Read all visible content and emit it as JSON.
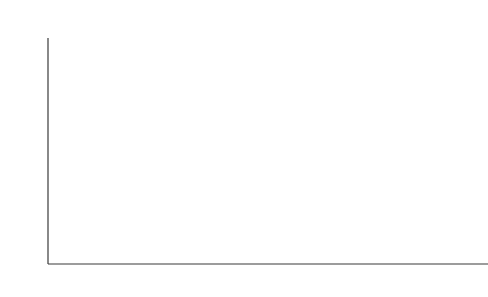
{
  "chart_data": {
    "type": "area",
    "title": "",
    "xlabel": "",
    "ylabel": "EJ",
    "ylim": [
      0,
      1200
    ],
    "ytick_values": [
      0,
      200,
      400,
      600,
      800,
      1000,
      1200
    ],
    "ytick_labels": [
      "0",
      "200",
      "400",
      "600",
      "800",
      "1000",
      "1200"
    ],
    "xtick_labels": [
      "1950",
      "1960",
      "1970",
      "1980",
      "1990",
      "2000",
      "2008",
      "2030",
      "2050"
    ],
    "grid": false,
    "legend_position": "upper-left",
    "legend": [
      {
        "label": "Other renewables",
        "color": "#ffffff"
      },
      {
        "label": "Hydro",
        "color": "#111111"
      },
      {
        "label": "Nuclear",
        "color": "#f2f2f2"
      },
      {
        "label": "Gas",
        "color": "#d4d4d4"
      },
      {
        "label": "Oil",
        "color": "#b4b4b4"
      },
      {
        "label": "Coal",
        "color": "#8c8c8c"
      },
      {
        "label": "Biomass",
        "color": "#5e5e5e"
      }
    ],
    "series_order": [
      "Biomass",
      "Coal",
      "Oil",
      "Gas",
      "Nuclear",
      "Hydro",
      "Other renewables"
    ],
    "historical": {
      "x": [
        1950,
        1955,
        1960,
        1965,
        1970,
        1975,
        1980,
        1985,
        1990,
        1995,
        2000,
        2005,
        2008
      ],
      "series": [
        {
          "name": "Biomass",
          "values": [
            26,
            27,
            28,
            29,
            31,
            33,
            35,
            37,
            39,
            41,
            43,
            45,
            46
          ]
        },
        {
          "name": "Coal",
          "values": [
            45,
            48,
            52,
            55,
            58,
            62,
            70,
            78,
            84,
            83,
            88,
            110,
            128
          ]
        },
        {
          "name": "Oil",
          "values": [
            20,
            30,
            42,
            62,
            95,
            115,
            126,
            118,
            128,
            136,
            148,
            160,
            166
          ]
        },
        {
          "name": "Gas",
          "values": [
            7,
            11,
            17,
            26,
            38,
            46,
            54,
            63,
            72,
            80,
            90,
            102,
            108
          ]
        },
        {
          "name": "Nuclear",
          "values": [
            0,
            0,
            1,
            2,
            3,
            8,
            14,
            22,
            28,
            30,
            31,
            31,
            30
          ]
        },
        {
          "name": "Hydro",
          "values": [
            3,
            4,
            6,
            8,
            10,
            13,
            15,
            18,
            21,
            23,
            25,
            27,
            28
          ]
        },
        {
          "name": "Other renewables",
          "values": [
            0,
            0,
            0,
            0,
            0,
            0,
            0,
            1,
            1,
            2,
            3,
            5,
            7
          ]
        }
      ],
      "totals": [
        101,
        120,
        146,
        182,
        235,
        277,
        314,
        337,
        373,
        395,
        428,
        480,
        513
      ]
    },
    "scenarios": [
      {
        "year": "2030",
        "label": "GEA – efficiency",
        "total": 590,
        "values": {
          "Biomass": 60,
          "Coal": 95,
          "Oil": 155,
          "Gas": 120,
          "Nuclear": 38,
          "Hydro": 40,
          "Other renewables": 82
        }
      },
      {
        "year": "2030",
        "label": "GEA – mix",
        "total": 585,
        "values": {
          "Biomass": 72,
          "Coal": 105,
          "Oil": 140,
          "Gas": 130,
          "Nuclear": 36,
          "Hydro": 42,
          "Other renewables": 60
        }
      },
      {
        "year": "2030",
        "label": "GEA – supply",
        "total": 590,
        "values": {
          "Biomass": 70,
          "Coal": 110,
          "Oil": 145,
          "Gas": 135,
          "Nuclear": 35,
          "Hydro": 40,
          "Other renewables": 55
        }
      },
      {
        "year": "2050",
        "label": "GEA – efficiency",
        "total": 630,
        "values": {
          "Biomass": 72,
          "Coal": 55,
          "Oil": 90,
          "Gas": 100,
          "Nuclear": 20,
          "Hydro": 48,
          "Other renewables": 245
        }
      },
      {
        "year": "2050",
        "label": "GEA – mix",
        "total": 900,
        "values": {
          "Biomass": 110,
          "Coal": 95,
          "Oil": 120,
          "Gas": 170,
          "Nuclear": 35,
          "Hydro": 55,
          "Other renewables": 315
        }
      },
      {
        "year": "2050",
        "label": "GEA – supply",
        "total": 1085,
        "values": {
          "Biomass": 130,
          "Coal": 125,
          "Oil": 145,
          "Gas": 205,
          "Nuclear": 40,
          "Hydro": 60,
          "Other renewables": 380
        }
      }
    ]
  }
}
